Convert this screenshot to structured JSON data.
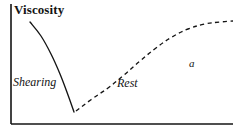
{
  "figure": {
    "background_color": "#ffffff",
    "ink_color": "#141414",
    "width": 233,
    "height": 136
  },
  "chart_data": {
    "type": "line",
    "title": "Viscosity",
    "xlabel": "",
    "ylabel": "Viscosity",
    "grid": false,
    "legend_position": "none",
    "axes": {
      "y_axis_label": "Viscosity",
      "x_axis_label": "",
      "x_tick_labels": [],
      "y_tick_labels": [],
      "xlim": [
        0,
        100
      ],
      "ylim": [
        0,
        100
      ]
    },
    "annotations": [
      {
        "text": "Shearing",
        "style": "italic",
        "x": 13,
        "y": 76
      },
      {
        "text": "Rest",
        "style": "italic",
        "x": 117,
        "y": 77
      },
      {
        "text": "a",
        "style": "italic",
        "x": 189,
        "y": 58
      }
    ],
    "series": [
      {
        "name": "Shearing",
        "style": "solid",
        "color": "#141414",
        "description": "Viscosity decreases sharply during shearing",
        "points": [
          [
            30,
            22
          ],
          [
            41,
            36
          ],
          [
            51,
            54
          ],
          [
            60,
            74
          ],
          [
            68,
            95
          ],
          [
            74,
            112
          ]
        ]
      },
      {
        "name": "Rest",
        "style": "dashed",
        "color": "#141414",
        "description": "Viscosity recovers gradually at rest, approaching a plateau",
        "points": [
          [
            76,
            111
          ],
          [
            92,
            99
          ],
          [
            108,
            88
          ],
          [
            124,
            75
          ],
          [
            140,
            61
          ],
          [
            156,
            48
          ],
          [
            172,
            37
          ],
          [
            188,
            29
          ],
          [
            205,
            24
          ],
          [
            220,
            22
          ],
          [
            233,
            21
          ]
        ]
      }
    ]
  },
  "labels": {
    "title": "Viscosity",
    "shearing": "Shearing",
    "rest": "Rest",
    "annotation_a": "a"
  }
}
